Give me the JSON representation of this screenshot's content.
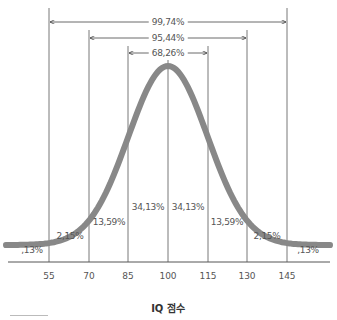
{
  "chart_data": {
    "type": "line",
    "title": "",
    "xlabel": "IQ 점수",
    "ylabel": "",
    "x_ticks": [
      55,
      70,
      85,
      100,
      115,
      130,
      145
    ],
    "x_tick_labels": [
      "55",
      "70",
      "85",
      "100",
      "115",
      "130",
      "145"
    ],
    "curve": {
      "type": "normal",
      "mean": 100,
      "sd": 15,
      "color": "#888888"
    },
    "segments": [
      {
        "range": "<55",
        "label": ",13%",
        "value": 0.13
      },
      {
        "range": "55-70",
        "label": "2,15%",
        "value": 2.15
      },
      {
        "range": "70-85",
        "label": "13,59%",
        "value": 13.59
      },
      {
        "range": "85-100",
        "label": "34,13%",
        "value": 34.13
      },
      {
        "range": "100-115",
        "label": "34,13%",
        "value": 34.13
      },
      {
        "range": "115-130",
        "label": "13,59%",
        "value": 13.59
      },
      {
        "range": "130-145",
        "label": "2,15%",
        "value": 2.15
      },
      {
        "range": ">145",
        "label": ",13%",
        "value": 0.13
      }
    ],
    "ranges": [
      {
        "from": 55,
        "to": 145,
        "label": "99,74%",
        "value": 99.74
      },
      {
        "from": 70,
        "to": 130,
        "label": "95,44%",
        "value": 95.44
      },
      {
        "from": 85,
        "to": 115,
        "label": "68,26%",
        "value": 68.26
      }
    ],
    "grid": false,
    "legend": "none"
  },
  "labels": {
    "seg0": ",13%",
    "seg1": "2,15%",
    "seg2": "13,59%",
    "seg3": "34,13%",
    "seg4": "34,13%",
    "seg5": "13,59%",
    "seg6": "2,15%",
    "seg7": ",13%",
    "range0": "99,74%",
    "range1": "95,44%",
    "range2": "68,26%",
    "tick0": "55",
    "tick1": "70",
    "tick2": "85",
    "tick3": "100",
    "tick4": "115",
    "tick5": "130",
    "tick6": "145",
    "xlabel": "IQ 점수"
  }
}
